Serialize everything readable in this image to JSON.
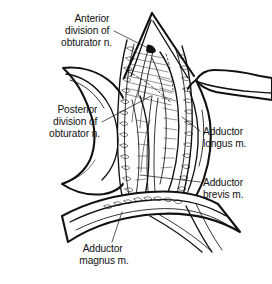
{
  "figure": {
    "style": "black-and-white pen-and-ink line drawing",
    "background_color": "#ffffff",
    "ink_color": "#111111",
    "width": 272,
    "height": 284
  },
  "labels": [
    {
      "id": "anterior-division",
      "lines": [
        "Anterior",
        "division of",
        "obturator n."
      ],
      "align": "end",
      "x": 112,
      "y": 22,
      "line_height": 12,
      "leader": {
        "from_x": 114,
        "from_y": 31,
        "to_x": 148,
        "to_y": 48
      }
    },
    {
      "id": "posterior-division",
      "lines": [
        "Posterior",
        "division of",
        "obturator n."
      ],
      "align": "end",
      "x": 100,
      "y": 113,
      "line_height": 12,
      "leader": {
        "from_x": 102,
        "from_y": 122,
        "to_x": 151,
        "to_y": 96
      }
    },
    {
      "id": "adductor-longus",
      "lines": [
        "Adductor",
        "longus m."
      ],
      "align": "start",
      "x": 203,
      "y": 135,
      "line_height": 12,
      "leader": {
        "from_x": 200,
        "from_y": 131,
        "to_x": 182,
        "to_y": 117
      }
    },
    {
      "id": "adductor-brevis",
      "lines": [
        "Adductor",
        "brevis m."
      ],
      "align": "start",
      "x": 203,
      "y": 186,
      "line_height": 12,
      "leader": {
        "from_x": 200,
        "from_y": 182,
        "to_x": 140,
        "to_y": 175
      }
    },
    {
      "id": "adductor-magnus",
      "lines": [
        "Adductor",
        "magnus m."
      ],
      "align": "middle",
      "x": 104,
      "y": 252,
      "line_height": 12,
      "leader": {
        "from_x": 112,
        "from_y": 242,
        "to_x": 122,
        "to_y": 212
      }
    }
  ],
  "structures": [
    {
      "id": "wound-apex",
      "name": "superior apex of surgical incision"
    },
    {
      "id": "left-skin-flap",
      "name": "retracted skin and fascia flap, left"
    },
    {
      "id": "right-skin-flap",
      "name": "retracted skin and fascia flap, right"
    },
    {
      "id": "fat-margin-left",
      "name": "subcutaneous fat along left wound margin"
    },
    {
      "id": "fat-margin-right",
      "name": "subcutaneous fat along right wound margin"
    },
    {
      "id": "adductor-longus-belly",
      "name": "adductor longus muscle belly"
    },
    {
      "id": "adductor-brevis-belly",
      "name": "adductor brevis muscle belly"
    },
    {
      "id": "adductor-magnus-band",
      "name": "adductor magnus muscle band, inferior"
    },
    {
      "id": "anterior-division-nerve",
      "name": "anterior division of obturator nerve"
    },
    {
      "id": "posterior-division-nerve",
      "name": "posterior division of obturator nerve"
    },
    {
      "id": "deep-dashed-outline",
      "name": "dashed outline of deep structure"
    }
  ]
}
